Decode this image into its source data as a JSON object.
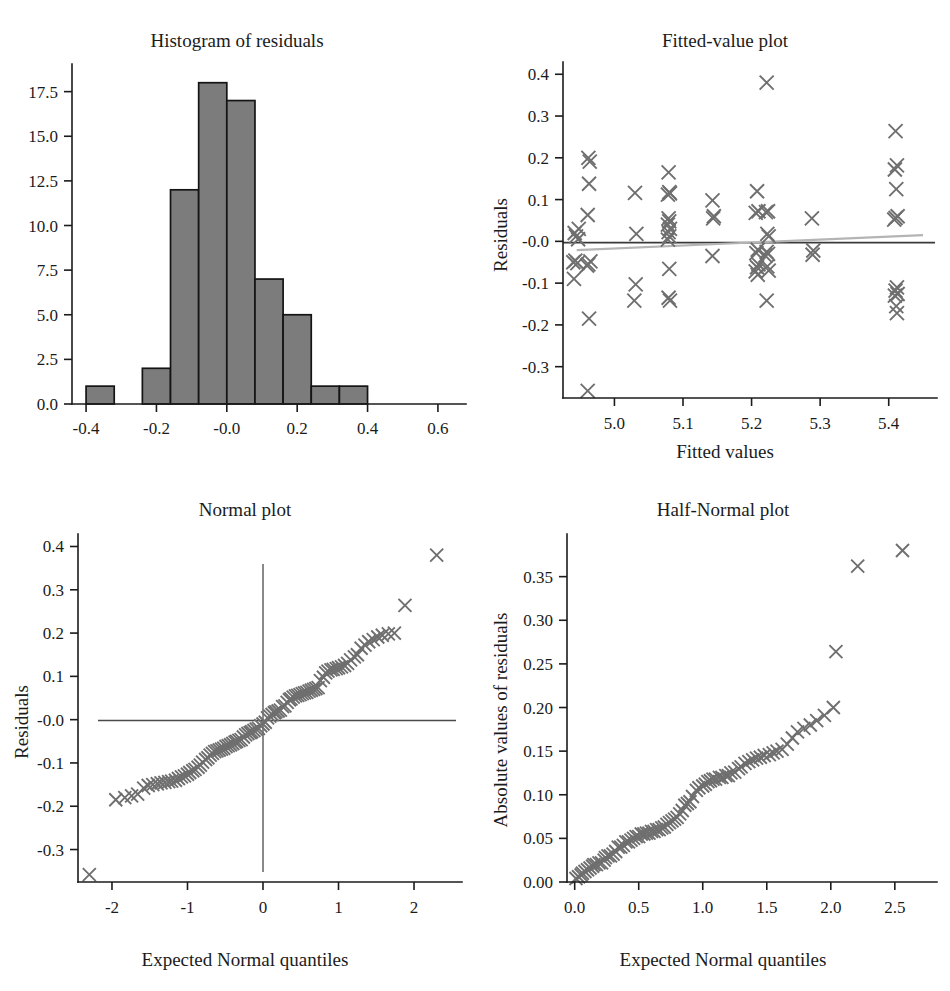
{
  "figure": {
    "background": "#ffffff",
    "marker_color": "#6f6f6f",
    "bar_fill_color": "#7c7c7c",
    "bar_edge_color": "#141414",
    "zero_line_color": "#3a3a3a",
    "smooth_line_color": "#b4b4b4"
  },
  "panels": {
    "histogram": {
      "title": "Histogram of residuals",
      "xlabel": "",
      "ylabel": "",
      "x_ticks": [
        "-0.4",
        "-0.2",
        "-0.0",
        "0.2",
        "0.4",
        "0.6"
      ],
      "y_ticks": [
        "0.0",
        "2.5",
        "5.0",
        "7.5",
        "10.0",
        "12.5",
        "15.0",
        "17.5"
      ]
    },
    "fitted": {
      "title": "Fitted-value plot",
      "xlabel": "Fitted values",
      "ylabel": "Residuals",
      "x_ticks": [
        "5.0",
        "5.1",
        "5.2",
        "5.3",
        "5.4"
      ],
      "y_ticks": [
        "-0.3",
        "-0.2",
        "-0.1",
        "-0.0",
        "0.1",
        "0.2",
        "0.3",
        "0.4"
      ]
    },
    "normal": {
      "title": "Normal plot",
      "xlabel": "Expected Normal quantiles",
      "ylabel": "Residuals",
      "x_ticks": [
        "-2",
        "-1",
        "0",
        "1",
        "2"
      ],
      "y_ticks": [
        "-0.3",
        "-0.2",
        "-0.1",
        "-0.0",
        "0.1",
        "0.2",
        "0.3",
        "0.4"
      ]
    },
    "halfnormal": {
      "title": "Half-Normal plot",
      "xlabel": "Expected Normal quantiles",
      "ylabel": "Absolute values of residuals",
      "x_ticks": [
        "0.0",
        "0.5",
        "1.0",
        "1.5",
        "2.0",
        "2.5"
      ],
      "y_ticks": [
        "0.00",
        "0.05",
        "0.10",
        "0.15",
        "0.20",
        "0.25",
        "0.30",
        "0.35"
      ]
    }
  },
  "chart_data": [
    {
      "id": "histogram",
      "type": "bar",
      "title": "Histogram of residuals",
      "xlabel": "",
      "ylabel": "",
      "xlim": [
        -0.44,
        0.64
      ],
      "ylim": [
        0,
        18.6
      ],
      "grid": false,
      "legend": "none",
      "bin_width": 0.08,
      "bin_edges": [
        -0.4,
        -0.32,
        -0.24,
        -0.16,
        -0.08,
        0.0,
        0.08,
        0.16,
        0.24,
        0.32,
        0.4
      ],
      "values": [
        1,
        0,
        2,
        12,
        18,
        17,
        7,
        5,
        1,
        1
      ],
      "x_tick_values": [
        -0.4,
        -0.2,
        -0.0,
        0.2,
        0.4,
        0.6
      ],
      "y_tick_values": [
        0.0,
        2.5,
        5.0,
        7.5,
        10.0,
        12.5,
        15.0,
        17.5
      ]
    },
    {
      "id": "fitted",
      "type": "scatter",
      "title": "Fitted-value plot",
      "xlabel": "Fitted values",
      "ylabel": "Residuals",
      "xlim": [
        4.925,
        5.45
      ],
      "ylim": [
        -0.375,
        0.415
      ],
      "grid": false,
      "legend": "none",
      "x_tick_values": [
        5.0,
        5.1,
        5.2,
        5.3,
        5.4
      ],
      "y_tick_values": [
        -0.3,
        -0.2,
        -0.1,
        -0.0,
        0.1,
        0.2,
        0.3,
        0.4
      ],
      "annotations": [
        {
          "name": "zero-line",
          "type": "hline",
          "y": -0.003,
          "color": "#3a3a3a"
        },
        {
          "name": "lowess-smooth",
          "type": "line",
          "x": [
            4.945,
            5.45
          ],
          "y": [
            -0.021,
            0.015
          ],
          "color": "#b4b4b4"
        }
      ],
      "points": [
        [
          4.942,
          0.02
        ],
        [
          4.944,
          0.012
        ],
        [
          4.947,
          0.005
        ],
        [
          4.94,
          -0.05
        ],
        [
          4.946,
          -0.052
        ],
        [
          4.943,
          -0.046
        ],
        [
          4.941,
          -0.09
        ],
        [
          4.948,
          0.03
        ],
        [
          4.962,
          0.2
        ],
        [
          4.964,
          0.191
        ],
        [
          4.963,
          0.138
        ],
        [
          4.961,
          0.063
        ],
        [
          4.965,
          -0.048
        ],
        [
          4.962,
          -0.055
        ],
        [
          4.96,
          -0.058
        ],
        [
          4.963,
          -0.185
        ],
        [
          4.961,
          -0.358
        ],
        [
          5.03,
          0.116
        ],
        [
          5.032,
          0.018
        ],
        [
          5.031,
          -0.103
        ],
        [
          5.029,
          -0.142
        ],
        [
          5.079,
          0.165
        ],
        [
          5.08,
          0.118
        ],
        [
          5.078,
          0.112
        ],
        [
          5.081,
          0.115
        ],
        [
          5.079,
          0.055
        ],
        [
          5.08,
          0.048
        ],
        [
          5.078,
          0.04
        ],
        [
          5.081,
          0.03
        ],
        [
          5.079,
          0.022
        ],
        [
          5.08,
          0.012
        ],
        [
          5.078,
          0.004
        ],
        [
          5.08,
          -0.066
        ],
        [
          5.079,
          -0.135
        ],
        [
          5.081,
          -0.142
        ],
        [
          5.143,
          0.098
        ],
        [
          5.145,
          0.06
        ],
        [
          5.144,
          0.055
        ],
        [
          5.143,
          -0.035
        ],
        [
          5.208,
          0.12
        ],
        [
          5.21,
          0.072
        ],
        [
          5.206,
          0.068
        ],
        [
          5.209,
          -0.02
        ],
        [
          5.207,
          -0.028
        ],
        [
          5.21,
          -0.055
        ],
        [
          5.208,
          -0.062
        ],
        [
          5.206,
          -0.072
        ],
        [
          5.209,
          -0.08
        ],
        [
          5.222,
          0.38
        ],
        [
          5.224,
          0.072
        ],
        [
          5.221,
          0.07
        ],
        [
          5.223,
          0.018
        ],
        [
          5.225,
          0.012
        ],
        [
          5.222,
          -0.025
        ],
        [
          5.224,
          -0.03
        ],
        [
          5.22,
          -0.034
        ],
        [
          5.223,
          -0.06
        ],
        [
          5.225,
          -0.07
        ],
        [
          5.222,
          -0.142
        ],
        [
          5.288,
          0.055
        ],
        [
          5.29,
          -0.022
        ],
        [
          5.289,
          -0.032
        ],
        [
          5.41,
          0.264
        ],
        [
          5.412,
          0.182
        ],
        [
          5.409,
          0.172
        ],
        [
          5.411,
          0.125
        ],
        [
          5.413,
          0.06
        ],
        [
          5.41,
          0.056
        ],
        [
          5.408,
          0.052
        ],
        [
          5.412,
          -0.11
        ],
        [
          5.41,
          -0.118
        ],
        [
          5.413,
          -0.126
        ],
        [
          5.409,
          -0.13
        ],
        [
          5.411,
          -0.155
        ],
        [
          5.412,
          -0.172
        ]
      ]
    },
    {
      "id": "normal",
      "type": "scatter",
      "title": "Normal plot",
      "xlabel": "Expected Normal quantiles",
      "ylabel": "Residuals",
      "xlim": [
        -2.45,
        2.45
      ],
      "ylim": [
        -0.375,
        0.415
      ],
      "grid": false,
      "legend": "none",
      "x_tick_values": [
        -2,
        -1,
        0,
        1,
        2
      ],
      "y_tick_values": [
        -0.3,
        -0.2,
        -0.1,
        -0.0,
        0.1,
        0.2,
        0.3,
        0.4
      ],
      "annotations": [
        {
          "name": "vertical-crosshair",
          "type": "vline",
          "x": 0.0,
          "color": "#4a4a4a"
        },
        {
          "name": "horizontal-crosshair",
          "type": "hline",
          "y": -0.002,
          "color": "#4a4a4a"
        }
      ],
      "points": [
        [
          -2.3,
          -0.358
        ],
        [
          -1.95,
          -0.185
        ],
        [
          -1.83,
          -0.18
        ],
        [
          -1.74,
          -0.176
        ],
        [
          -1.66,
          -0.172
        ],
        [
          -1.58,
          -0.158
        ],
        [
          -1.52,
          -0.152
        ],
        [
          -1.46,
          -0.15
        ],
        [
          -1.4,
          -0.148
        ],
        [
          -1.35,
          -0.146
        ],
        [
          -1.3,
          -0.145
        ],
        [
          -1.25,
          -0.143
        ],
        [
          -1.21,
          -0.142
        ],
        [
          -1.16,
          -0.14
        ],
        [
          -1.12,
          -0.136
        ],
        [
          -1.08,
          -0.132
        ],
        [
          -1.04,
          -0.13
        ],
        [
          -1.0,
          -0.126
        ],
        [
          -0.97,
          -0.122
        ],
        [
          -0.93,
          -0.118
        ],
        [
          -0.9,
          -0.115
        ],
        [
          -0.86,
          -0.11
        ],
        [
          -0.83,
          -0.105
        ],
        [
          -0.8,
          -0.098
        ],
        [
          -0.76,
          -0.092
        ],
        [
          -0.73,
          -0.088
        ],
        [
          -0.7,
          -0.082
        ],
        [
          -0.67,
          -0.078
        ],
        [
          -0.64,
          -0.074
        ],
        [
          -0.61,
          -0.072
        ],
        [
          -0.58,
          -0.07
        ],
        [
          -0.55,
          -0.068
        ],
        [
          -0.52,
          -0.066
        ],
        [
          -0.49,
          -0.062
        ],
        [
          -0.46,
          -0.06
        ],
        [
          -0.43,
          -0.058
        ],
        [
          -0.4,
          -0.055
        ],
        [
          -0.37,
          -0.052
        ],
        [
          -0.35,
          -0.05
        ],
        [
          -0.32,
          -0.048
        ],
        [
          -0.29,
          -0.046
        ],
        [
          -0.26,
          -0.04
        ],
        [
          -0.23,
          -0.035
        ],
        [
          -0.2,
          -0.032
        ],
        [
          -0.17,
          -0.03
        ],
        [
          -0.15,
          -0.028
        ],
        [
          -0.12,
          -0.025
        ],
        [
          -0.09,
          -0.022
        ],
        [
          -0.06,
          -0.02
        ],
        [
          -0.03,
          -0.014
        ],
        [
          0.0,
          -0.01
        ],
        [
          0.03,
          -0.006
        ],
        [
          0.06,
          0.004
        ],
        [
          0.09,
          0.008
        ],
        [
          0.12,
          0.012
        ],
        [
          0.15,
          0.016
        ],
        [
          0.17,
          0.018
        ],
        [
          0.2,
          0.02
        ],
        [
          0.23,
          0.022
        ],
        [
          0.26,
          0.03
        ],
        [
          0.29,
          0.032
        ],
        [
          0.32,
          0.04
        ],
        [
          0.35,
          0.046
        ],
        [
          0.37,
          0.048
        ],
        [
          0.4,
          0.052
        ],
        [
          0.43,
          0.055
        ],
        [
          0.46,
          0.056
        ],
        [
          0.49,
          0.058
        ],
        [
          0.52,
          0.06
        ],
        [
          0.55,
          0.062
        ],
        [
          0.58,
          0.063
        ],
        [
          0.61,
          0.066
        ],
        [
          0.64,
          0.068
        ],
        [
          0.67,
          0.07
        ],
        [
          0.7,
          0.072
        ],
        [
          0.73,
          0.074
        ],
        [
          0.76,
          0.09
        ],
        [
          0.8,
          0.098
        ],
        [
          0.83,
          0.108
        ],
        [
          0.86,
          0.112
        ],
        [
          0.9,
          0.115
        ],
        [
          0.93,
          0.116
        ],
        [
          0.97,
          0.118
        ],
        [
          1.0,
          0.12
        ],
        [
          1.04,
          0.122
        ],
        [
          1.08,
          0.125
        ],
        [
          1.12,
          0.13
        ],
        [
          1.16,
          0.138
        ],
        [
          1.21,
          0.145
        ],
        [
          1.25,
          0.15
        ],
        [
          1.3,
          0.165
        ],
        [
          1.35,
          0.172
        ],
        [
          1.4,
          0.18
        ],
        [
          1.46,
          0.185
        ],
        [
          1.52,
          0.191
        ],
        [
          1.58,
          0.195
        ],
        [
          1.66,
          0.198
        ],
        [
          1.74,
          0.2
        ],
        [
          1.88,
          0.264
        ],
        [
          2.3,
          0.38
        ]
      ]
    },
    {
      "id": "halfnormal",
      "type": "scatter",
      "title": "Half-Normal plot",
      "xlabel": "Expected Normal quantiles",
      "ylabel": "Absolute values of residuals",
      "xlim": [
        -0.06,
        2.72
      ],
      "ylim": [
        0.0,
        0.392
      ],
      "grid": false,
      "legend": "none",
      "x_tick_values": [
        0.0,
        0.5,
        1.0,
        1.5,
        2.0,
        2.5
      ],
      "y_tick_values": [
        0.0,
        0.05,
        0.1,
        0.15,
        0.2,
        0.25,
        0.3,
        0.35
      ],
      "points": [
        [
          0.01,
          0.004
        ],
        [
          0.03,
          0.006
        ],
        [
          0.05,
          0.008
        ],
        [
          0.06,
          0.01
        ],
        [
          0.08,
          0.012
        ],
        [
          0.1,
          0.014
        ],
        [
          0.12,
          0.016
        ],
        [
          0.14,
          0.018
        ],
        [
          0.15,
          0.02
        ],
        [
          0.17,
          0.02
        ],
        [
          0.19,
          0.022
        ],
        [
          0.21,
          0.022
        ],
        [
          0.23,
          0.025
        ],
        [
          0.24,
          0.028
        ],
        [
          0.26,
          0.03
        ],
        [
          0.28,
          0.03
        ],
        [
          0.3,
          0.032
        ],
        [
          0.32,
          0.035
        ],
        [
          0.34,
          0.04
        ],
        [
          0.36,
          0.04
        ],
        [
          0.38,
          0.042
        ],
        [
          0.4,
          0.046
        ],
        [
          0.42,
          0.046
        ],
        [
          0.44,
          0.048
        ],
        [
          0.46,
          0.05
        ],
        [
          0.48,
          0.052
        ],
        [
          0.5,
          0.052
        ],
        [
          0.52,
          0.055
        ],
        [
          0.54,
          0.055
        ],
        [
          0.56,
          0.056
        ],
        [
          0.58,
          0.056
        ],
        [
          0.6,
          0.058
        ],
        [
          0.62,
          0.058
        ],
        [
          0.64,
          0.06
        ],
        [
          0.66,
          0.06
        ],
        [
          0.68,
          0.062
        ],
        [
          0.7,
          0.063
        ],
        [
          0.72,
          0.066
        ],
        [
          0.74,
          0.068
        ],
        [
          0.76,
          0.07
        ],
        [
          0.78,
          0.072
        ],
        [
          0.8,
          0.074
        ],
        [
          0.82,
          0.078
        ],
        [
          0.84,
          0.082
        ],
        [
          0.86,
          0.088
        ],
        [
          0.88,
          0.09
        ],
        [
          0.9,
          0.092
        ],
        [
          0.92,
          0.098
        ],
        [
          0.95,
          0.105
        ],
        [
          0.97,
          0.108
        ],
        [
          1.0,
          0.11
        ],
        [
          1.02,
          0.112
        ],
        [
          1.04,
          0.115
        ],
        [
          1.06,
          0.116
        ],
        [
          1.08,
          0.118
        ],
        [
          1.1,
          0.118
        ],
        [
          1.13,
          0.12
        ],
        [
          1.15,
          0.12
        ],
        [
          1.18,
          0.122
        ],
        [
          1.2,
          0.122
        ],
        [
          1.22,
          0.125
        ],
        [
          1.25,
          0.126
        ],
        [
          1.28,
          0.13
        ],
        [
          1.3,
          0.132
        ],
        [
          1.33,
          0.136
        ],
        [
          1.36,
          0.138
        ],
        [
          1.39,
          0.14
        ],
        [
          1.42,
          0.142
        ],
        [
          1.45,
          0.143
        ],
        [
          1.48,
          0.145
        ],
        [
          1.52,
          0.146
        ],
        [
          1.55,
          0.148
        ],
        [
          1.58,
          0.15
        ],
        [
          1.62,
          0.152
        ],
        [
          1.66,
          0.158
        ],
        [
          1.7,
          0.165
        ],
        [
          1.74,
          0.172
        ],
        [
          1.79,
          0.176
        ],
        [
          1.84,
          0.18
        ],
        [
          1.89,
          0.185
        ],
        [
          1.95,
          0.191
        ],
        [
          2.02,
          0.2
        ],
        [
          2.04,
          0.264
        ],
        [
          2.21,
          0.362
        ],
        [
          2.56,
          0.38
        ]
      ]
    }
  ]
}
